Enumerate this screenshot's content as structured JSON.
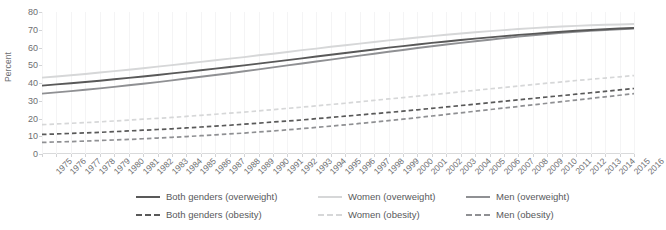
{
  "chart_data": {
    "type": "line",
    "title": "",
    "xlabel": "",
    "ylabel": "Percent",
    "ylim": [
      0,
      80
    ],
    "ytick_step": 10,
    "yticks": [
      0,
      10,
      20,
      30,
      40,
      50,
      60,
      70,
      80
    ],
    "grid": "vertical-faint",
    "legend_position": "bottom",
    "x": [
      1975,
      1976,
      1977,
      1978,
      1979,
      1980,
      1981,
      1982,
      1983,
      1984,
      1985,
      1986,
      1987,
      1988,
      1989,
      1990,
      1991,
      1992,
      1993,
      1994,
      1995,
      1996,
      1997,
      1998,
      1999,
      2000,
      2001,
      2002,
      2003,
      2004,
      2005,
      2006,
      2007,
      2008,
      2009,
      2010,
      2011,
      2012,
      2013,
      2014,
      2015,
      2016
    ],
    "categories": [
      "1975",
      "1976",
      "1977",
      "1978",
      "1979",
      "1980",
      "1981",
      "1982",
      "1983",
      "1984",
      "1985",
      "1986",
      "1987",
      "1988",
      "1989",
      "1990",
      "1991",
      "1992",
      "1993",
      "1994",
      "1995",
      "1996",
      "1997",
      "1998",
      "1999",
      "2000",
      "2001",
      "2002",
      "2003",
      "2004",
      "2005",
      "2006",
      "2007",
      "2008",
      "2009",
      "2010",
      "2011",
      "2012",
      "2013",
      "2014",
      "2015",
      "2016"
    ],
    "series": [
      {
        "name": "Both genders (overweight)",
        "style": "solid",
        "color": "#595959",
        "values": [
          38.5,
          39.2,
          39.9,
          40.6,
          41.3,
          42.1,
          42.9,
          43.7,
          44.5,
          45.4,
          46.3,
          47.2,
          48.1,
          49.0,
          49.9,
          50.9,
          51.9,
          52.9,
          53.9,
          54.9,
          55.9,
          56.9,
          57.9,
          58.9,
          59.9,
          60.8,
          61.7,
          62.6,
          63.4,
          64.2,
          65.0,
          65.7,
          66.4,
          67.1,
          67.7,
          68.3,
          68.9,
          69.4,
          69.9,
          70.3,
          70.7,
          71.0
        ]
      },
      {
        "name": "Women (overweight)",
        "style": "solid",
        "color": "#d6d7d8",
        "values": [
          43.0,
          43.7,
          44.4,
          45.1,
          45.9,
          46.7,
          47.5,
          48.3,
          49.2,
          50.1,
          51.0,
          51.9,
          52.8,
          53.7,
          54.6,
          55.6,
          56.5,
          57.5,
          58.5,
          59.4,
          60.4,
          61.3,
          62.2,
          63.1,
          64.0,
          64.8,
          65.6,
          66.4,
          67.2,
          67.9,
          68.6,
          69.2,
          69.8,
          70.4,
          70.9,
          71.4,
          71.8,
          72.2,
          72.5,
          72.8,
          73.0,
          73.2
        ]
      },
      {
        "name": "Men (overweight)",
        "style": "solid",
        "color": "#8f9093",
        "values": [
          34.0,
          34.7,
          35.4,
          36.2,
          37.0,
          37.8,
          38.7,
          39.6,
          40.5,
          41.5,
          42.5,
          43.5,
          44.5,
          45.5,
          46.6,
          47.7,
          48.8,
          49.9,
          51.0,
          52.1,
          53.2,
          54.3,
          55.4,
          56.5,
          57.6,
          58.6,
          59.7,
          60.7,
          61.7,
          62.6,
          63.5,
          64.4,
          65.3,
          66.1,
          66.9,
          67.6,
          68.3,
          68.9,
          69.4,
          69.9,
          70.3,
          70.7
        ]
      },
      {
        "name": "Both genders (obesity)",
        "style": "dashed",
        "color": "#595959",
        "values": [
          11.0,
          11.3,
          11.6,
          11.9,
          12.2,
          12.6,
          13.0,
          13.4,
          13.8,
          14.2,
          14.7,
          15.2,
          15.7,
          16.2,
          16.8,
          17.4,
          18.0,
          18.6,
          19.2,
          19.9,
          20.6,
          21.3,
          22.0,
          22.7,
          23.4,
          24.1,
          24.9,
          25.7,
          26.5,
          27.3,
          28.1,
          28.9,
          29.7,
          30.5,
          31.3,
          32.1,
          32.9,
          33.7,
          34.5,
          35.3,
          36.1,
          36.9
        ]
      },
      {
        "name": "Women (obesity)",
        "style": "dashed",
        "color": "#d6d7d8",
        "values": [
          16.5,
          16.9,
          17.3,
          17.7,
          18.1,
          18.6,
          19.1,
          19.6,
          20.1,
          20.6,
          21.2,
          21.8,
          22.4,
          23.0,
          23.6,
          24.3,
          25.0,
          25.7,
          26.4,
          27.1,
          27.9,
          28.6,
          29.4,
          30.2,
          31.0,
          31.8,
          32.6,
          33.4,
          34.2,
          35.1,
          35.9,
          36.7,
          37.5,
          38.3,
          39.1,
          39.9,
          40.6,
          41.4,
          42.1,
          42.8,
          43.5,
          44.2
        ]
      },
      {
        "name": "Men (obesity)",
        "style": "dashed",
        "color": "#8f9093",
        "values": [
          6.5,
          6.8,
          7.0,
          7.3,
          7.6,
          7.9,
          8.2,
          8.6,
          9.0,
          9.4,
          9.8,
          10.3,
          10.8,
          11.3,
          11.8,
          12.4,
          13.0,
          13.6,
          14.3,
          15.0,
          15.7,
          16.4,
          17.2,
          18.0,
          18.8,
          19.6,
          20.5,
          21.4,
          22.3,
          23.2,
          24.1,
          25.0,
          25.9,
          26.8,
          27.7,
          28.6,
          29.5,
          30.4,
          31.3,
          32.2,
          33.1,
          34.0
        ]
      }
    ]
  },
  "legend": {
    "items": [
      {
        "label": "Both genders (overweight)",
        "color": "#595959",
        "style": "solid"
      },
      {
        "label": "Women (overweight)",
        "color": "#d6d7d8",
        "style": "solid"
      },
      {
        "label": "Men (overweight)",
        "color": "#8f9093",
        "style": "solid"
      },
      {
        "label": "Both genders (obesity)",
        "color": "#595959",
        "style": "dashed"
      },
      {
        "label": "Women (obesity)",
        "color": "#d6d7d8",
        "style": "dashed"
      },
      {
        "label": "Men (obesity)",
        "color": "#8f9093",
        "style": "dashed"
      }
    ]
  },
  "colors": {
    "both_genders": "#595959",
    "women": "#d6d7d8",
    "men": "#8f9093",
    "axis": "#d9dadb",
    "tick_text": "#6d6e71",
    "grid": "#f4f4f5",
    "background": "#ffffff"
  }
}
